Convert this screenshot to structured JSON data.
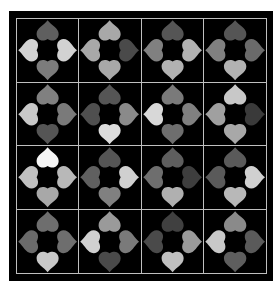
{
  "game": {
    "type": "heart-edge-matching-puzzle",
    "rows": 4,
    "cols": 4,
    "colors": {
      "frame": "#000000",
      "grid_line": "#bfbfbf",
      "background": "#ffffff"
    },
    "tiles": [
      [
        {
          "top": "#5f5f5f",
          "right": "#d2d2d2",
          "bottom": "#7c7c7c",
          "left": "#d2d2d2"
        },
        {
          "top": "#a8a8a8",
          "right": "#4a4a4a",
          "bottom": "#a8a8a8",
          "left": "#a8a8a8"
        },
        {
          "top": "#555555",
          "right": "#b2b2b2",
          "bottom": "#b2b2b2",
          "left": "#808080"
        },
        {
          "top": "#555555",
          "right": "#6a6a6a",
          "bottom": "#b2b2b2",
          "left": "#808080"
        }
      ],
      [
        {
          "top": "#808080",
          "right": "#7a7a7a",
          "bottom": "#555555",
          "left": "#c8c8c8"
        },
        {
          "top": "#555555",
          "right": "#8a8a8a",
          "bottom": "#dcdcdc",
          "left": "#4f4f4f"
        },
        {
          "top": "#7a7a7a",
          "right": "#808080",
          "bottom": "#6e6e6e",
          "left": "#d8d8d8"
        },
        {
          "top": "#c8c8c8",
          "right": "#3a3a3a",
          "bottom": "#a8a8a8",
          "left": "#a0a0a0"
        }
      ],
      [
        {
          "top": "#f5f5f5",
          "right": "#b8b8b8",
          "bottom": "#a8a8a8",
          "left": "#c0c0c0"
        },
        {
          "top": "#555555",
          "right": "#d0d0d0",
          "bottom": "#808080",
          "left": "#606060"
        },
        {
          "top": "#5e5e5e",
          "right": "#3e3e3e",
          "bottom": "#b0b0b0",
          "left": "#6e6e6e"
        },
        {
          "top": "#5a5a5a",
          "right": "#d0d0d0",
          "bottom": "#b8b8b8",
          "left": "#5a5a5a"
        }
      ],
      [
        {
          "top": "#6e6e6e",
          "right": "#6e6e6e",
          "bottom": "#c8c8c8",
          "left": "#6a6a6a"
        },
        {
          "top": "#9a9a9a",
          "right": "#7a7a7a",
          "bottom": "#4a4a4a",
          "left": "#d0d0d0"
        },
        {
          "top": "#404040",
          "right": "#9a9a9a",
          "bottom": "#c0c0c0",
          "left": "#4a4a4a"
        },
        {
          "top": "#8a8a8a",
          "right": "#5a5a5a",
          "bottom": "#5e5e5e",
          "left": "#c8c8c8"
        }
      ]
    ]
  }
}
